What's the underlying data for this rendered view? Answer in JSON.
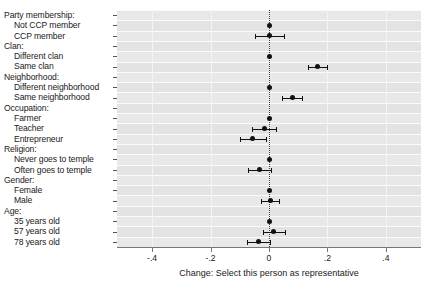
{
  "chart_data": {
    "type": "scatter",
    "title": "",
    "xlabel": "Change: Select this person as representative",
    "ylabel": "",
    "xlim": [
      -0.52,
      0.52
    ],
    "xticks": [
      -0.4,
      -0.2,
      0,
      0.2,
      0.4
    ],
    "xticklabels": [
      "-.4",
      "-.2",
      "0",
      ".2",
      ".4"
    ],
    "grid": true,
    "legend": "none",
    "reference_line": 0,
    "annotations": [
      "Dotted vertical line marks zero (no change)"
    ],
    "groups": [
      {
        "header": "Party membership:",
        "levels": [
          {
            "label": "Not CCP member",
            "estimate": 0.0,
            "ci_low": 0.0,
            "ci_high": 0.0,
            "reference": true
          },
          {
            "label": "CCP member",
            "estimate": 0.0,
            "ci_low": -0.048,
            "ci_high": 0.052,
            "reference": false
          }
        ]
      },
      {
        "header": "Clan:",
        "levels": [
          {
            "label": "Different clan",
            "estimate": 0.0,
            "ci_low": 0.0,
            "ci_high": 0.0,
            "reference": true
          },
          {
            "label": "Same clan",
            "estimate": 0.166,
            "ci_low": 0.132,
            "ci_high": 0.2,
            "reference": false
          }
        ]
      },
      {
        "header": "Neighborhood:",
        "levels": [
          {
            "label": "Different neighborhood",
            "estimate": 0.0,
            "ci_low": 0.0,
            "ci_high": 0.0,
            "reference": true
          },
          {
            "label": "Same neighborhood",
            "estimate": 0.079,
            "ci_low": 0.045,
            "ci_high": 0.114,
            "reference": false
          }
        ]
      },
      {
        "header": "Occupation:",
        "levels": [
          {
            "label": "Farmer",
            "estimate": 0.0,
            "ci_low": 0.0,
            "ci_high": 0.0,
            "reference": true
          },
          {
            "label": "Teacher",
            "estimate": -0.017,
            "ci_low": -0.058,
            "ci_high": 0.024,
            "reference": false
          },
          {
            "label": "Entrepreneur",
            "estimate": -0.055,
            "ci_low": -0.1,
            "ci_high": -0.01,
            "reference": false
          }
        ]
      },
      {
        "header": "Religion:",
        "levels": [
          {
            "label": "Never goes to temple",
            "estimate": 0.0,
            "ci_low": 0.0,
            "ci_high": 0.0,
            "reference": true
          },
          {
            "label": "Often goes to temple",
            "estimate": -0.034,
            "ci_low": -0.073,
            "ci_high": 0.006,
            "reference": false
          }
        ]
      },
      {
        "header": "Gender:",
        "levels": [
          {
            "label": "Female",
            "estimate": 0.0,
            "ci_low": 0.0,
            "ci_high": 0.0,
            "reference": true
          },
          {
            "label": "Male",
            "estimate": 0.004,
            "ci_low": -0.027,
            "ci_high": 0.035,
            "reference": false
          }
        ]
      },
      {
        "header": "Age:",
        "levels": [
          {
            "label": "35 years old",
            "estimate": 0.0,
            "ci_low": 0.0,
            "ci_high": 0.0,
            "reference": true
          },
          {
            "label": "57 years old",
            "estimate": 0.017,
            "ci_low": -0.021,
            "ci_high": 0.055,
            "reference": false
          },
          {
            "label": "78 years old",
            "estimate": -0.035,
            "ci_low": -0.075,
            "ci_high": 0.005,
            "reference": false
          }
        ]
      }
    ]
  }
}
